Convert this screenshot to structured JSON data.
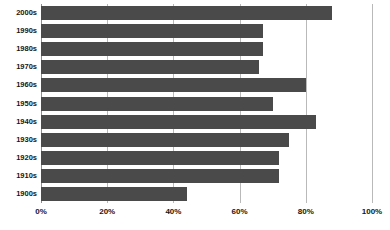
{
  "chart_data": {
    "type": "bar",
    "orientation": "horizontal",
    "title": "",
    "subtitle": "",
    "xlabel": "",
    "ylabel": "",
    "categories": [
      "2000s",
      "1990s",
      "1980s",
      "1970s",
      "1960s",
      "1950s",
      "1940s",
      "1930s",
      "1920s",
      "1910s",
      "1900s"
    ],
    "values": [
      88,
      67,
      67,
      66,
      80,
      70,
      83,
      75,
      72,
      72,
      44
    ],
    "xlim": [
      0,
      100
    ],
    "xticks": [
      0,
      20,
      40,
      60,
      80,
      100
    ],
    "xticklabels": [
      "0%",
      "20%",
      "40%",
      "60%",
      "80%",
      "100%"
    ],
    "grid": true,
    "grid_axis": "x",
    "legend": false,
    "bar_color": "#4a4a4a",
    "gridline_color": "#b9b9b9",
    "axis_color": "#8d8d8d",
    "background_color": "#ffffff",
    "series": [
      {
        "name": "",
        "values": [
          88,
          67,
          67,
          66,
          80,
          70,
          83,
          75,
          72,
          72,
          44
        ]
      }
    ]
  }
}
